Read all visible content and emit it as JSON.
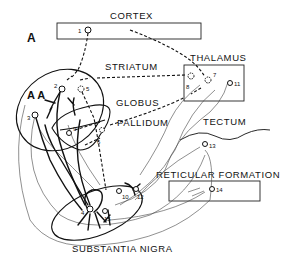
{
  "panel_label": "A",
  "secondary_label": "A A",
  "regions": {
    "cortex": "CORTEX",
    "striatum": "STRIATUM",
    "globus": "GLOBUS",
    "pallidum": "PALLIDUM",
    "thalamus": "THALAMUS",
    "tectum": "TECTUM",
    "reticular_formation": "RETICULAR FORMATION",
    "substantia_nigra": "SUBSTANTIA NIGRA"
  },
  "neurons": {
    "n1": "1",
    "n2": "2",
    "n3": "3",
    "n4": "4",
    "n5": "5",
    "n6": "6",
    "n7": "7",
    "n8": "8",
    "n9": "9",
    "n10": "10",
    "n11": "11",
    "n12": "12",
    "n13": "13",
    "n14": "14",
    "n15": "15"
  }
}
